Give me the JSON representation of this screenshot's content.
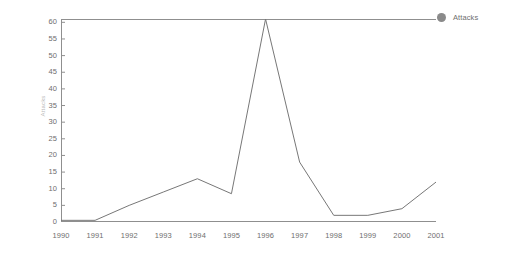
{
  "chart_data": {
    "type": "line",
    "title": "",
    "xlabel": "",
    "ylabel": "Attacks",
    "categories": [
      "1990",
      "1991",
      "1992",
      "1993",
      "1994",
      "1995",
      "1996",
      "1997",
      "1998",
      "1999",
      "2000",
      "2001"
    ],
    "series": [
      {
        "name": "Attacks",
        "values": [
          0.5,
          0.5,
          5,
          9,
          13,
          8.5,
          61,
          18,
          2,
          2,
          4,
          12
        ],
        "color": "#777777"
      }
    ],
    "xlim": [
      1990,
      2001
    ],
    "ylim": [
      0,
      61
    ],
    "ytick_labels": [
      "60",
      "55",
      "50",
      "45",
      "40",
      "35",
      "30",
      "25",
      "20",
      "15",
      "10",
      "5",
      "0"
    ],
    "ytick_values": [
      60,
      55,
      50,
      45,
      40,
      35,
      30,
      25,
      20,
      15,
      10,
      5,
      0
    ],
    "grid": false,
    "legend_position": "right",
    "legend": [
      {
        "label": "Attacks",
        "marker": "circle",
        "color": "#8a8a8a"
      }
    ],
    "axis_color": "#8f8f8f",
    "text_color": "#6e6e6e",
    "background": "#ffffff"
  }
}
